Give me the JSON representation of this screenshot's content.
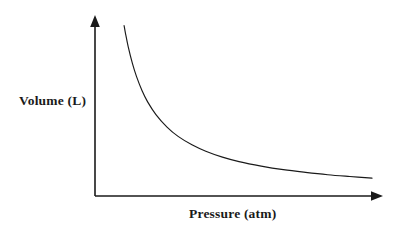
{
  "figure": {
    "background_color": "#ffffff",
    "line_color": "#1a1a1a",
    "axis_color": "#1a1a1a"
  },
  "chart_data": {
    "type": "line",
    "title": "",
    "subtitle": "",
    "xlabel": "Pressure (atm)",
    "ylabel": "Volume (L)",
    "grid": false,
    "legend": null,
    "legend_position": "none",
    "axis_arrows": true,
    "tick_labels_x": [],
    "tick_labels_y": [],
    "xlim": [
      0,
      10
    ],
    "ylim": [
      0,
      10
    ],
    "series": [
      {
        "name": "P vs V",
        "relation": "V = k / P",
        "k": 10,
        "x": [
          1.05,
          1.1,
          1.2,
          1.35,
          1.5,
          1.7,
          1.9,
          2.2,
          2.6,
          3.0,
          3.5,
          4.0,
          4.6,
          5.2,
          6.0,
          6.8,
          7.6,
          8.4,
          9.2,
          10.0
        ],
        "y": [
          9.52,
          9.09,
          8.33,
          7.41,
          6.67,
          5.88,
          5.26,
          4.55,
          3.85,
          3.33,
          2.86,
          2.5,
          2.17,
          1.92,
          1.67,
          1.47,
          1.32,
          1.19,
          1.09,
          1.0
        ]
      }
    ]
  },
  "labels": {
    "y_axis": "Volume (L)",
    "x_axis": "Pressure (atm)"
  },
  "icons": {
    "y_axis_arrow": "arrow-up-icon",
    "x_axis_arrow": "arrow-right-icon"
  }
}
